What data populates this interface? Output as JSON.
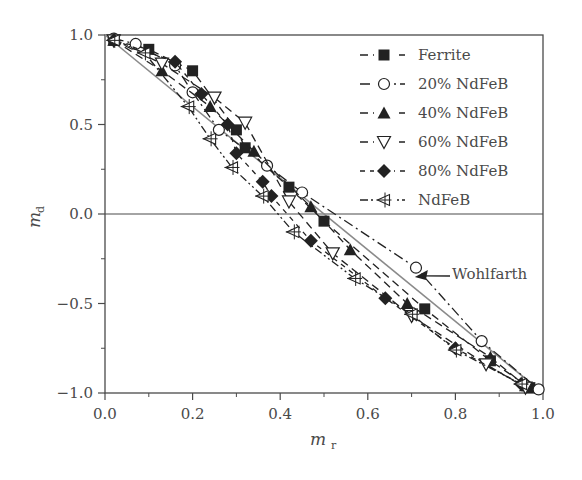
{
  "chart_data": {
    "type": "scatter",
    "title": "",
    "xlabel": "m_r",
    "ylabel": "m_d",
    "xlabel_main": "m",
    "xlabel_sub": "r",
    "ylabel_main": "m",
    "ylabel_sub": "d",
    "xlim": [
      0.0,
      1.0
    ],
    "ylim": [
      -1.0,
      1.0
    ],
    "xticks": [
      "0.0",
      "0.2",
      "0.4",
      "0.6",
      "0.8",
      "1.0"
    ],
    "yticks": [
      "1.0",
      "0.5",
      "0.0",
      "-0.5",
      "-1.0"
    ],
    "grid": false,
    "zero_line": true,
    "legend_position": "upper right",
    "annotation": {
      "text": "Wohlfarth",
      "arrow_to": [
        0.68,
        -0.29
      ]
    },
    "reference_line": {
      "name": "Wohlfarth",
      "x": [
        0.0,
        1.0
      ],
      "y": [
        1.0,
        -1.0
      ]
    },
    "series": [
      {
        "name": "Ferrite",
        "marker": "square-filled",
        "linestyle": "dash",
        "x": [
          0.02,
          0.1,
          0.2,
          0.3,
          0.32,
          0.42,
          0.5,
          0.73,
          0.88,
          0.97
        ],
        "y": [
          0.97,
          0.92,
          0.8,
          0.47,
          0.37,
          0.15,
          -0.04,
          -0.53,
          -0.82,
          -0.97
        ]
      },
      {
        "name": "20% NdFeB",
        "marker": "circle-open",
        "linestyle": "dashdot",
        "x": [
          0.02,
          0.07,
          0.16,
          0.2,
          0.26,
          0.37,
          0.45,
          0.71,
          0.86,
          0.99
        ],
        "y": [
          0.98,
          0.95,
          0.83,
          0.68,
          0.47,
          0.27,
          0.12,
          -0.3,
          -0.71,
          -0.98
        ]
      },
      {
        "name": "40% NdFeB",
        "marker": "triangle-up-filled",
        "linestyle": "dash",
        "x": [
          0.02,
          0.13,
          0.24,
          0.34,
          0.47,
          0.56,
          0.69,
          0.88,
          0.96
        ],
        "y": [
          0.97,
          0.8,
          0.6,
          0.35,
          0.04,
          -0.2,
          -0.5,
          -0.8,
          -0.96
        ]
      },
      {
        "name": "60% NdFeB",
        "marker": "triangle-down-open",
        "linestyle": "dash",
        "x": [
          0.02,
          0.13,
          0.25,
          0.32,
          0.42,
          0.52,
          0.7,
          0.87,
          0.96
        ],
        "y": [
          0.97,
          0.84,
          0.65,
          0.51,
          0.07,
          -0.22,
          -0.57,
          -0.84,
          -0.97
        ]
      },
      {
        "name": "80% NdFeB",
        "marker": "diamond-filled",
        "linestyle": "dashed-short",
        "x": [
          0.02,
          0.16,
          0.22,
          0.28,
          0.3,
          0.36,
          0.38,
          0.47,
          0.64,
          0.8,
          0.95
        ],
        "y": [
          0.97,
          0.85,
          0.67,
          0.5,
          0.34,
          0.18,
          0.1,
          -0.15,
          -0.47,
          -0.75,
          -0.95
        ]
      },
      {
        "name": "NdFeB",
        "marker": "triangle-left-cross",
        "linestyle": "dashdotdot",
        "x": [
          0.02,
          0.09,
          0.19,
          0.24,
          0.29,
          0.36,
          0.43,
          0.57,
          0.7,
          0.8,
          0.95
        ],
        "y": [
          0.97,
          0.9,
          0.6,
          0.42,
          0.26,
          0.1,
          -0.1,
          -0.36,
          -0.56,
          -0.76,
          -0.95
        ]
      }
    ]
  },
  "colors": {
    "axis": "#4a4a4a",
    "marker": "#222222",
    "wohlfarth": "#8a8a8a",
    "background": "#ffffff"
  }
}
